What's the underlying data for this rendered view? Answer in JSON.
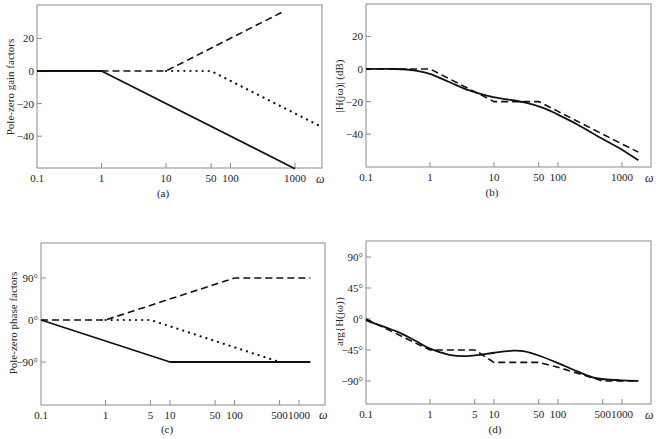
{
  "figure": {
    "x_axis_symbol": "ω"
  },
  "chart_data": [
    {
      "id": "a",
      "type": "line",
      "caption": "(a)",
      "title": "",
      "xlabel": "ω",
      "ylabel": "Pole-zero gain factors",
      "xscale": "log",
      "xlim": [
        0.1,
        2500
      ],
      "ylim": [
        -60,
        40
      ],
      "x_ticks": [
        0.1,
        1,
        10,
        50,
        100,
        1000
      ],
      "x_tick_labels": [
        "0.1",
        "1",
        "10",
        "50",
        "100",
        "1000"
      ],
      "y_ticks": [
        20,
        0,
        -20,
        -40
      ],
      "y_tick_labels": [
        "20",
        "0",
        "−20",
        "−40"
      ],
      "grid": false,
      "series": [
        {
          "name": "pole at ω=1 (asymptote)",
          "style": "solid",
          "x": [
            0.1,
            1,
            1000
          ],
          "y": [
            0,
            0,
            -60
          ]
        },
        {
          "name": "zero at ω=10 (asymptote)",
          "style": "dashed",
          "x": [
            1,
            10,
            700
          ],
          "y": [
            0,
            0,
            37
          ]
        },
        {
          "name": "pole at ω=50 (asymptote)",
          "style": "dotted",
          "x": [
            10,
            50,
            2500
          ],
          "y": [
            0,
            0,
            -34
          ]
        }
      ]
    },
    {
      "id": "b",
      "type": "line",
      "caption": "(b)",
      "title": "",
      "xlabel": "ω",
      "ylabel": "|H(jω)| (dB)",
      "xscale": "log",
      "xlim": [
        0.1,
        2500
      ],
      "ylim": [
        -60,
        40
      ],
      "x_ticks": [
        0.1,
        1,
        10,
        50,
        100,
        1000
      ],
      "x_tick_labels": [
        "0.1",
        "1",
        "10",
        "50",
        "100",
        "1000"
      ],
      "y_ticks": [
        20,
        0,
        -20,
        -40
      ],
      "y_tick_labels": [
        "20",
        "0",
        "−20",
        "−40"
      ],
      "grid": false,
      "series": [
        {
          "name": "exact magnitude",
          "style": "solid",
          "x": [
            0.1,
            0.3,
            0.6,
            1,
            2,
            4,
            8,
            15,
            30,
            60,
            100,
            200,
            500,
            1000,
            1800
          ],
          "y": [
            0,
            0,
            -1,
            -3,
            -8,
            -13,
            -16.5,
            -18.5,
            -20.5,
            -24,
            -28,
            -34,
            -43,
            -49.5,
            -56
          ]
        },
        {
          "name": "asymptotic magnitude",
          "style": "dashed",
          "x": [
            0.1,
            1,
            10,
            50,
            100,
            1000,
            1800
          ],
          "y": [
            0,
            0,
            -20,
            -20,
            -26,
            -46,
            -51
          ]
        }
      ]
    },
    {
      "id": "c",
      "type": "line",
      "caption": "(c)",
      "title": "",
      "xlabel": "ω",
      "ylabel": "Pole-zero phase factors",
      "xscale": "log",
      "xlim": [
        0.1,
        2500
      ],
      "ylim": [
        -180,
        180
      ],
      "x_ticks": [
        0.1,
        1,
        5,
        10,
        50,
        100,
        500,
        1000
      ],
      "x_tick_labels": [
        "0.1",
        "1",
        "5",
        "10",
        "50",
        "100",
        "500",
        "1000"
      ],
      "y_ticks": [
        90,
        0,
        -90
      ],
      "y_tick_labels": [
        "90°",
        "0°",
        "−90°"
      ],
      "grid": false,
      "series": [
        {
          "name": "pole at ω=1 (phase asymptote)",
          "style": "solid",
          "x": [
            0.1,
            10,
            1500
          ],
          "y": [
            0,
            -90,
            -90
          ]
        },
        {
          "name": "zero at ω=10 (phase asymptote)",
          "style": "dashed",
          "x": [
            0.1,
            1,
            100,
            1500
          ],
          "y": [
            0,
            0,
            90,
            90
          ]
        },
        {
          "name": "pole at ω=50 (phase asymptote)",
          "style": "dotted",
          "x": [
            1,
            5,
            500
          ],
          "y": [
            0,
            0,
            -90
          ]
        }
      ]
    },
    {
      "id": "d",
      "type": "line",
      "caption": "(d)",
      "title": "",
      "xlabel": "ω",
      "ylabel": "arg{H(jω)}",
      "xscale": "log",
      "xlim": [
        0.1,
        2500
      ],
      "ylim": [
        -125,
        125
      ],
      "x_ticks": [
        0.1,
        1,
        5,
        10,
        50,
        100,
        500,
        1000
      ],
      "x_tick_labels": [
        "0.1",
        "1",
        "5",
        "10",
        "50",
        "100",
        "500",
        "1000"
      ],
      "y_ticks": [
        90,
        45,
        0,
        -45,
        -90
      ],
      "y_tick_labels": [
        "90°",
        "45°",
        "0°",
        "−45°",
        "−90°"
      ],
      "grid": false,
      "series": [
        {
          "name": "exact phase",
          "style": "solid",
          "x": [
            0.1,
            0.3,
            0.6,
            1,
            2,
            3.5,
            6,
            10,
            20,
            30,
            50,
            100,
            200,
            400,
            1000,
            1800
          ],
          "y": [
            -2,
            -18,
            -32,
            -43,
            -52,
            -54,
            -52,
            -49,
            -46,
            -47,
            -53,
            -64,
            -76,
            -86,
            -89,
            -90
          ]
        },
        {
          "name": "asymptotic phase",
          "style": "dashed",
          "x": [
            0.1,
            1,
            5,
            10,
            50,
            100,
            500,
            1800
          ],
          "y": [
            0,
            -45,
            -45,
            -63,
            -63,
            -70,
            -90,
            -90
          ]
        }
      ]
    }
  ]
}
